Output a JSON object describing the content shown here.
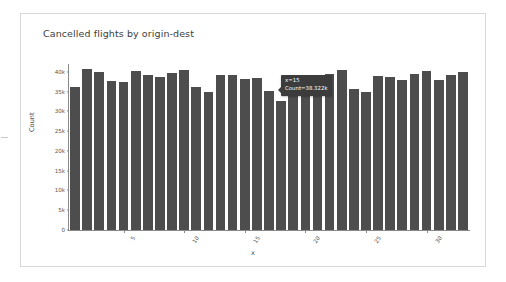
{
  "card": {
    "title": "Cancelled flights by origin-dest"
  },
  "tooltip": {
    "line1": "x=15",
    "line2": "Count=38.322k",
    "bg_color": "#3c3c3c",
    "text_color": "#ffffff"
  },
  "chart_data": {
    "type": "bar",
    "title": "Cancelled flights by origin-dest",
    "xlabel": "x",
    "ylabel": "Count",
    "ylim": [
      0,
      42000
    ],
    "grid": false,
    "legend": null,
    "bar_color": "#4d4d4d",
    "ytick_labels": [
      "0",
      "5k",
      "10k",
      "15k",
      "20k",
      "25k",
      "30k",
      "35k",
      "40k"
    ],
    "ytick_values": [
      0,
      5000,
      10000,
      15000,
      20000,
      25000,
      30000,
      35000,
      40000
    ],
    "xtick_labels": [
      "5",
      "10",
      "15",
      "20",
      "25",
      "30"
    ],
    "xtick_values": [
      5,
      10,
      15,
      20,
      25,
      30
    ],
    "categories": [
      1,
      2,
      3,
      4,
      5,
      6,
      7,
      8,
      9,
      10,
      11,
      12,
      13,
      14,
      15,
      16,
      17,
      18,
      19,
      20,
      21,
      22,
      23,
      24,
      25,
      26,
      27,
      28,
      29,
      30,
      31,
      32,
      33
    ],
    "values": [
      36100,
      40800,
      40000,
      37600,
      37400,
      40200,
      39200,
      38600,
      39700,
      40400,
      36100,
      35000,
      39100,
      39100,
      38322,
      38500,
      35100,
      32600,
      36900,
      38500,
      38100,
      39500,
      40400,
      35600,
      34800,
      38900,
      38800,
      38000,
      39500,
      40200,
      38000,
      39200,
      40000
    ],
    "annotations": [
      {
        "label": "x=15",
        "value": "Count=38.322k",
        "at_x": 15
      }
    ]
  }
}
